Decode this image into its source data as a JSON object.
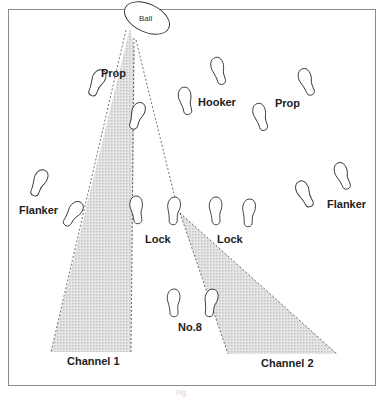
{
  "diagram": {
    "ball_label": "Ball",
    "players": [
      {
        "label": "Prop",
        "x": 101,
        "y": 67
      },
      {
        "label": "Hooker",
        "x": 198,
        "y": 96
      },
      {
        "label": "Prop",
        "x": 275,
        "y": 97
      },
      {
        "label": "Flanker",
        "x": 19,
        "y": 208
      },
      {
        "label": "Lock",
        "x": 145,
        "y": 235
      },
      {
        "label": "Lock",
        "x": 217,
        "y": 235
      },
      {
        "label": "Flanker",
        "x": 327,
        "y": 200
      },
      {
        "label": "No.8",
        "x": 178,
        "y": 323
      }
    ],
    "channels": [
      {
        "label": "Channel 1"
      },
      {
        "label": "Channel 2"
      }
    ],
    "caption": "Fig."
  },
  "colors": {
    "frame": "#8a8a8a",
    "shading": "#d9d9d9",
    "stroke": "#333333"
  }
}
